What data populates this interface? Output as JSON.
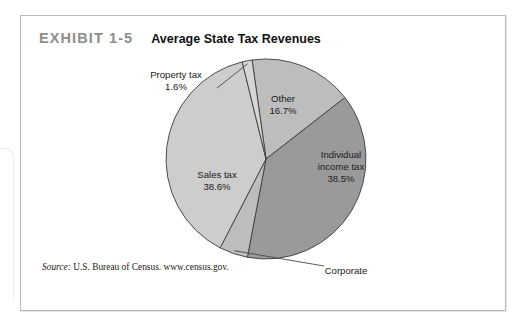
{
  "exhibit": {
    "label": "EXHIBIT 1-5",
    "title": "Average State Tax Revenues"
  },
  "source": {
    "prefix": "Source:",
    "text": "U.S. Bureau of Census. www.census.gov."
  },
  "colors": {
    "slice_other": "#bdbdbd",
    "slice_individual": "#9a9a9a",
    "slice_corporate": "#bdbdbd",
    "slice_sales": "#cdcdcd",
    "slice_property": "#d6d6d6",
    "outline": "#3d3d3d",
    "frame": "#b9b9b9",
    "exhibit_label": "#8d8d8d"
  },
  "chart_data": {
    "type": "pie",
    "title": "Average State Tax Revenues",
    "start_angle_deg": -8,
    "direction": "clockwise",
    "legend": "none",
    "labels_inside": [
      "Other",
      "Individual income tax",
      "Sales tax"
    ],
    "labels_callout": [
      "Property tax",
      "Corporate income tax"
    ],
    "slices": [
      {
        "name": "Other",
        "label": "Other",
        "value": 16.7,
        "value_label": "16.7%",
        "color": "#bdbdbd",
        "label_placement": "inside",
        "label_x": 262,
        "label_y": 56
      },
      {
        "name": "Individual income tax",
        "label_line1": "Individual",
        "label_line2": "income tax",
        "value": 38.5,
        "value_label": "38.5%",
        "color": "#9a9a9a",
        "label_placement": "inside",
        "label_x": 320,
        "label_y": 112
      },
      {
        "name": "Corporate income tax",
        "label_line1": "Corporate",
        "label_line2": "income tax",
        "value": 4.6,
        "value_label": "4.6%",
        "color": "#bdbdbd",
        "label_placement": "callout",
        "label_x": 325,
        "label_y": 228
      },
      {
        "name": "Sales tax",
        "label": "Sales tax",
        "value": 38.6,
        "value_label": "38.6%",
        "color": "#cdcdcd",
        "label_placement": "inside",
        "label_x": 196,
        "label_y": 132
      },
      {
        "name": "Property tax",
        "label": "Property tax",
        "value": 1.6,
        "value_label": "1.6%",
        "color": "#d6d6d6",
        "label_placement": "callout",
        "label_x": 155,
        "label_y": 32
      }
    ],
    "total": 100.0,
    "units": "percent"
  }
}
